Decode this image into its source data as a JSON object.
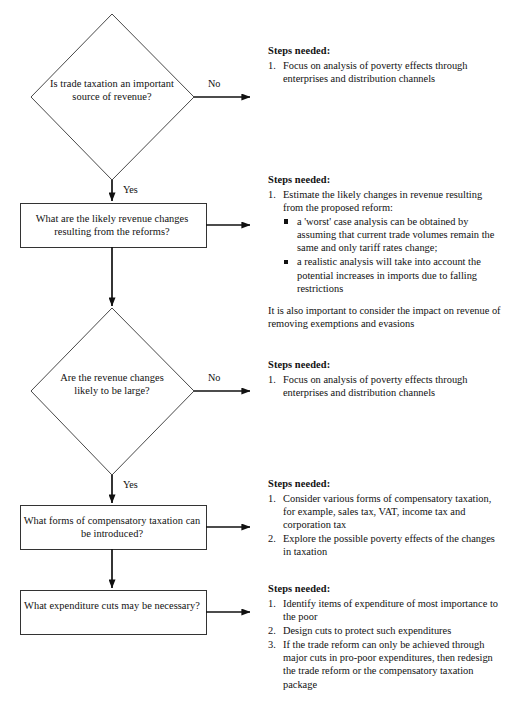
{
  "figure": {
    "type": "flowchart",
    "orientation": "vertical-with-right-annotations",
    "background_color": "#ffffff",
    "line_color": "#111111"
  },
  "nodes": [
    {
      "id": "n1",
      "shape": "diamond",
      "text": "Is trade taxation an important source of revenue?"
    },
    {
      "id": "n2",
      "shape": "rectangle",
      "text": "What are the likely revenue changes resulting from the reforms?"
    },
    {
      "id": "n3",
      "shape": "diamond",
      "text": "Are the revenue changes likely to be large?"
    },
    {
      "id": "n4",
      "shape": "rectangle",
      "text": "What forms of compensatory taxation can be introduced?"
    },
    {
      "id": "n5",
      "shape": "rectangle",
      "text": "What expenditure cuts may be necessary?"
    }
  ],
  "edge_labels": {
    "no_1": "No",
    "yes_1": "Yes",
    "no_2": "No",
    "yes_2": "Yes"
  },
  "steps": {
    "block1": {
      "title": "Steps needed:",
      "items": [
        {
          "num": "1.",
          "text": "Focus on analysis of poverty effects through enterprises and distribution channels"
        }
      ]
    },
    "block2": {
      "title": "Steps needed:",
      "items": [
        {
          "num": "1.",
          "text": "Estimate the likely changes in revenue resulting from the proposed reform:",
          "sub": [
            "a 'worst' case analysis can be obtained by assuming that current trade volumes remain the same and only tariff rates change;",
            "a realistic analysis will take into account the potential increases in imports due to falling restrictions"
          ]
        }
      ],
      "note": "It is also important to consider the impact on revenue of removing exemptions and evasions"
    },
    "block3": {
      "title": "Steps needed:",
      "items": [
        {
          "num": "1.",
          "text": "Focus on analysis of poverty effects through enterprises and distribution channels"
        }
      ]
    },
    "block4": {
      "title": "Steps needed:",
      "items": [
        {
          "num": "1.",
          "text": "Consider various forms of compensatory taxation, for example, sales tax, VAT, income tax and corporation tax"
        },
        {
          "num": "2.",
          "text": "Explore the possible poverty effects of the changes in taxation"
        }
      ]
    },
    "block5": {
      "title": "Steps needed:",
      "items": [
        {
          "num": "1.",
          "text": "Identify items of expenditure of most importance to the poor"
        },
        {
          "num": "2.",
          "text": "Design cuts to protect such expenditures"
        },
        {
          "num": "3.",
          "text": "If the trade reform can only be achieved through major cuts in pro-poor expenditures, then redesign the trade reform or the compensatory taxation package"
        }
      ]
    }
  },
  "footer": {
    "text": ""
  }
}
